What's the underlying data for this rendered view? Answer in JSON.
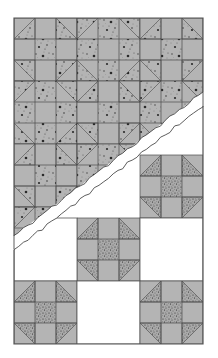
{
  "colors": {
    "background": "#ffffff",
    "fabric_gray": "#b4b4b4",
    "print_dark": "#2a2a2a",
    "seam": "#4a4a4a",
    "border": "#555555",
    "torn_band": "#ffffff"
  },
  "grid": {
    "x0": 14,
    "y0": 18,
    "cell": 21,
    "cols": 9,
    "bottom": 344
  },
  "upper_section": {
    "description": "Dense all-over Shoofly pattern with mottled print",
    "rows": 8,
    "print_style": "mottled"
  },
  "torn_band": {
    "description": "Diagonal torn separator between the two settings",
    "top_right": [
      203,
      92
    ],
    "bottom_left": [
      14,
      236
    ]
  },
  "lower_section": {
    "description": "Shoofly blocks alternating with plain white squares",
    "print_style": "speckled",
    "block_size": 63,
    "blocks": [
      {
        "col": 2,
        "row_from_bottom": 3,
        "type": "shoofly"
      },
      {
        "col": 1,
        "row_from_bottom": 2,
        "type": "shoofly"
      },
      {
        "col": 0,
        "row_from_bottom": 2,
        "type": "plain"
      },
      {
        "col": 2,
        "row_from_bottom": 2,
        "type": "plain"
      },
      {
        "col": 0,
        "row_from_bottom": 1,
        "type": "shoofly"
      },
      {
        "col": 1,
        "row_from_bottom": 1,
        "type": "plain"
      },
      {
        "col": 2,
        "row_from_bottom": 1,
        "type": "shoofly"
      }
    ]
  }
}
